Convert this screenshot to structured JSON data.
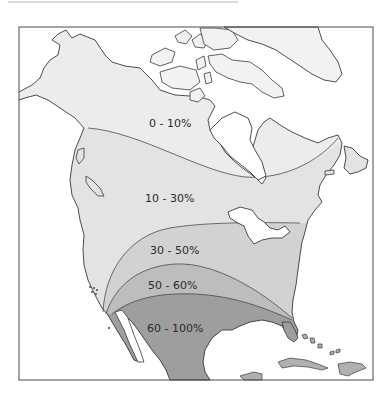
{
  "map": {
    "type": "choropleth",
    "region": "North America",
    "frame": {
      "x": 19,
      "y": 27,
      "width": 354,
      "height": 353
    },
    "colors": {
      "water": "#ffffff",
      "outline": "#3a3a3a",
      "frame": "#4a4a4a",
      "land_unshaded": "#f2f2f2"
    },
    "bands": [
      {
        "label": "0 - 10%",
        "fill": "#ececec",
        "label_x": 149,
        "label_y": 127
      },
      {
        "label": "10 - 30%",
        "fill": "#e3e3e3",
        "label_x": 145,
        "label_y": 202
      },
      {
        "label": "30 - 50%",
        "fill": "#d2d2d2",
        "label_x": 150,
        "label_y": 254
      },
      {
        "label": "50 - 60%",
        "fill": "#bdbdbd",
        "label_x": 148,
        "label_y": 289
      },
      {
        "label": "60 - 100%",
        "fill": "#9e9e9e",
        "label_x": 147,
        "label_y": 332
      }
    ]
  }
}
